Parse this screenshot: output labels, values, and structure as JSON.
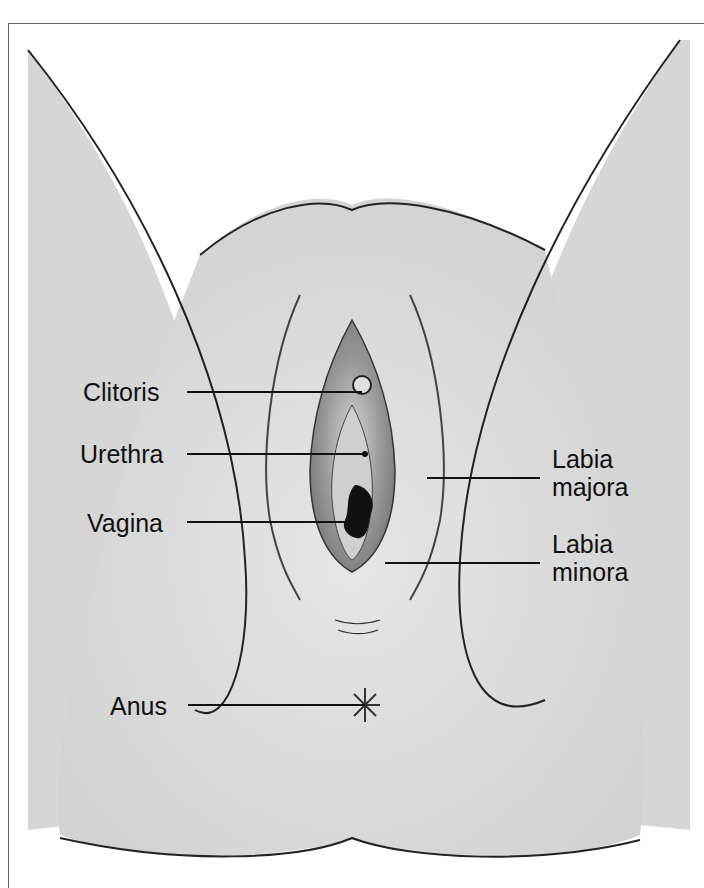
{
  "diagram": {
    "type": "anatomical illustration",
    "labels": {
      "clitoris": "Clitoris",
      "urethra": "Urethra",
      "vagina": "Vagina",
      "labia_majora": "Labia\nmajora",
      "labia_minora": "Labia\nminora",
      "anus": "Anus"
    },
    "colors": {
      "skin": "#dcdcdc",
      "skin_light": "#e8e8e8",
      "inner_dark": "#8a8a8a",
      "inner_mid": "#b5b5b5",
      "opening": "#111111",
      "outline": "#222222",
      "leader_line": "#111111"
    }
  }
}
